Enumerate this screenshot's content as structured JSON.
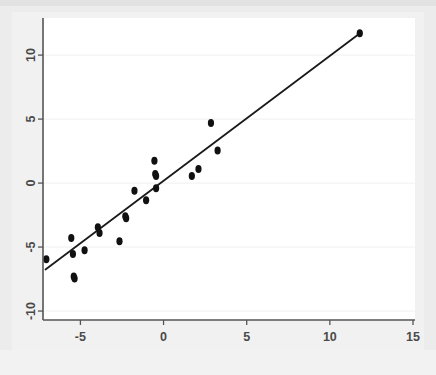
{
  "chart_data": {
    "type": "scatter",
    "title": "",
    "subtitle": "",
    "xlabel": "",
    "ylabel": "",
    "xlim": [
      -7.25,
      15.12
    ],
    "ylim": [
      -10.7,
      12.9
    ],
    "xticks": [
      -5,
      0,
      5,
      10,
      15
    ],
    "xticklabels": [
      "-5",
      "0",
      "5",
      "10",
      "15"
    ],
    "yticks": [
      -10,
      -5,
      0,
      5,
      10
    ],
    "yticklabels": [
      "-10",
      "-5",
      "0",
      "5",
      "10"
    ],
    "grid": "horizontal",
    "grid_color": "#f0f0f0",
    "legend": "none",
    "marker_color": "#111111",
    "marker_shape": "filled-ellipse",
    "series": [
      {
        "name": "observations",
        "type": "scatter",
        "points": [
          {
            "x": -7.05,
            "y": -5.95
          },
          {
            "x": -5.55,
            "y": -4.3
          },
          {
            "x": -5.45,
            "y": -5.55
          },
          {
            "x": -5.4,
            "y": -7.3
          },
          {
            "x": -5.35,
            "y": -7.45
          },
          {
            "x": -4.75,
            "y": -5.25
          },
          {
            "x": -3.95,
            "y": -3.45
          },
          {
            "x": -3.85,
            "y": -3.9
          },
          {
            "x": -2.65,
            "y": -4.55
          },
          {
            "x": -2.3,
            "y": -2.6
          },
          {
            "x": -2.25,
            "y": -2.75
          },
          {
            "x": -1.75,
            "y": -0.6
          },
          {
            "x": -1.05,
            "y": -1.35
          },
          {
            "x": -0.55,
            "y": 1.75
          },
          {
            "x": -0.5,
            "y": 0.7
          },
          {
            "x": -0.45,
            "y": 0.55
          },
          {
            "x": -0.45,
            "y": -0.4
          },
          {
            "x": 1.7,
            "y": 0.55
          },
          {
            "x": 2.1,
            "y": 1.1
          },
          {
            "x": 2.85,
            "y": 4.7
          },
          {
            "x": 3.25,
            "y": 2.55
          },
          {
            "x": 11.8,
            "y": 11.7
          }
        ]
      },
      {
        "name": "fitted-line",
        "type": "line",
        "x_start": -7.1,
        "y_start": -6.75,
        "x_end": 11.85,
        "y_end": 11.75,
        "color": "#1a1a1a"
      }
    ]
  },
  "axes": {
    "x_axis_name": "x-axis",
    "y_axis_name": "y-axis"
  }
}
